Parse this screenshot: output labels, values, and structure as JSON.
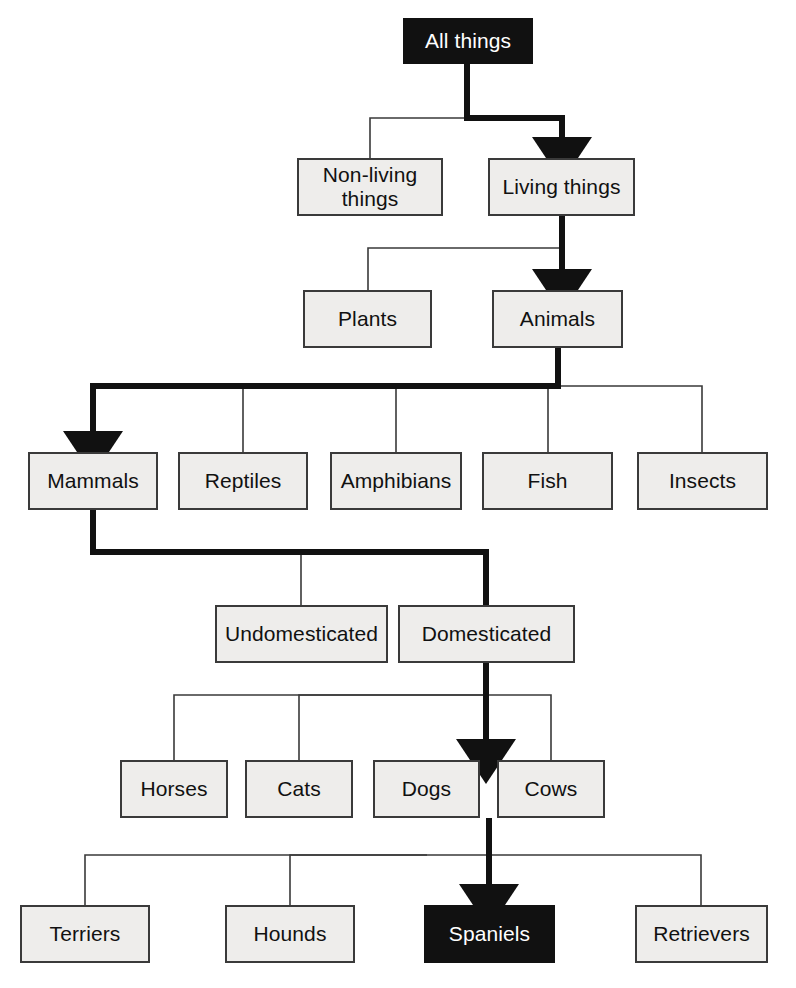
{
  "diagram": {
    "type": "hierarchy-tree",
    "colors": {
      "box_fill": "#eeedeb",
      "box_border": "#3a3a3a",
      "highlight_fill": "#111111",
      "highlight_text": "#ffffff",
      "text": "#111111",
      "edge": "#3a3a3a",
      "emphasis_edge": "#111111",
      "background": "#ffffff"
    },
    "levels": [
      {
        "level": 1,
        "nodes": [
          {
            "id": "all-things",
            "label": "All things",
            "highlight": true,
            "x": 403,
            "y": 18,
            "w": 130,
            "h": 46
          }
        ]
      },
      {
        "level": 2,
        "nodes": [
          {
            "id": "non-living-things",
            "label": "Non-living\nthings",
            "highlight": false,
            "x": 297,
            "y": 158,
            "w": 146,
            "h": 58
          },
          {
            "id": "living-things",
            "label": "Living things",
            "highlight": false,
            "x": 488,
            "y": 158,
            "w": 147,
            "h": 58
          }
        ]
      },
      {
        "level": 3,
        "nodes": [
          {
            "id": "plants",
            "label": "Plants",
            "highlight": false,
            "x": 303,
            "y": 290,
            "w": 129,
            "h": 58
          },
          {
            "id": "animals",
            "label": "Animals",
            "highlight": false,
            "x": 492,
            "y": 290,
            "w": 131,
            "h": 58
          }
        ]
      },
      {
        "level": 4,
        "nodes": [
          {
            "id": "mammals",
            "label": "Mammals",
            "highlight": false,
            "x": 28,
            "y": 452,
            "w": 130,
            "h": 58
          },
          {
            "id": "reptiles",
            "label": "Reptiles",
            "highlight": false,
            "x": 178,
            "y": 452,
            "w": 130,
            "h": 58
          },
          {
            "id": "amphibians",
            "label": "Amphibians",
            "highlight": false,
            "x": 330,
            "y": 452,
            "w": 132,
            "h": 58
          },
          {
            "id": "fish",
            "label": "Fish",
            "highlight": false,
            "x": 482,
            "y": 452,
            "w": 131,
            "h": 58
          },
          {
            "id": "insects",
            "label": "Insects",
            "highlight": false,
            "x": 637,
            "y": 452,
            "w": 131,
            "h": 58
          }
        ]
      },
      {
        "level": 5,
        "nodes": [
          {
            "id": "undomesticated",
            "label": "Undomesticated",
            "highlight": false,
            "x": 215,
            "y": 605,
            "w": 173,
            "h": 58
          },
          {
            "id": "domesticated",
            "label": "Domesticated",
            "highlight": false,
            "x": 398,
            "y": 605,
            "w": 177,
            "h": 58
          }
        ]
      },
      {
        "level": 6,
        "nodes": [
          {
            "id": "horses",
            "label": "Horses",
            "highlight": false,
            "x": 120,
            "y": 760,
            "w": 108,
            "h": 58
          },
          {
            "id": "cats",
            "label": "Cats",
            "highlight": false,
            "x": 245,
            "y": 760,
            "w": 108,
            "h": 58
          },
          {
            "id": "dogs",
            "label": "Dogs",
            "highlight": false,
            "x": 373,
            "y": 760,
            "w": 107,
            "h": 58
          },
          {
            "id": "cows",
            "label": "Cows",
            "highlight": false,
            "x": 497,
            "y": 760,
            "w": 108,
            "h": 58
          }
        ]
      },
      {
        "level": 7,
        "nodes": [
          {
            "id": "terriers",
            "label": "Terriers",
            "highlight": false,
            "x": 20,
            "y": 905,
            "w": 130,
            "h": 58
          },
          {
            "id": "hounds",
            "label": "Hounds",
            "highlight": false,
            "x": 225,
            "y": 905,
            "w": 130,
            "h": 58
          },
          {
            "id": "spaniels",
            "label": "Spaniels",
            "highlight": true,
            "x": 424,
            "y": 905,
            "w": 131,
            "h": 58
          },
          {
            "id": "retrievers",
            "label": "Retrievers",
            "highlight": false,
            "x": 635,
            "y": 905,
            "w": 133,
            "h": 58
          }
        ]
      }
    ],
    "edges": [
      {
        "from": "all-things",
        "to": "non-living-things",
        "emphasis": false
      },
      {
        "from": "all-things",
        "to": "living-things",
        "emphasis": true
      },
      {
        "from": "living-things",
        "to": "plants",
        "emphasis": false
      },
      {
        "from": "living-things",
        "to": "animals",
        "emphasis": true
      },
      {
        "from": "animals",
        "to": "mammals",
        "emphasis": true
      },
      {
        "from": "animals",
        "to": "reptiles",
        "emphasis": false
      },
      {
        "from": "animals",
        "to": "amphibians",
        "emphasis": false
      },
      {
        "from": "animals",
        "to": "fish",
        "emphasis": false
      },
      {
        "from": "animals",
        "to": "insects",
        "emphasis": false
      },
      {
        "from": "mammals",
        "to": "undomesticated",
        "emphasis": false
      },
      {
        "from": "mammals",
        "to": "domesticated",
        "emphasis": true
      },
      {
        "from": "domesticated",
        "to": "horses",
        "emphasis": false
      },
      {
        "from": "domesticated",
        "to": "cats",
        "emphasis": false
      },
      {
        "from": "domesticated",
        "to": "dogs",
        "emphasis": true
      },
      {
        "from": "domesticated",
        "to": "cows",
        "emphasis": false
      },
      {
        "from": "dogs",
        "to": "terriers",
        "emphasis": false
      },
      {
        "from": "dogs",
        "to": "hounds",
        "emphasis": false
      },
      {
        "from": "dogs",
        "to": "spaniels",
        "emphasis": true
      },
      {
        "from": "dogs",
        "to": "retrievers",
        "emphasis": false
      }
    ]
  }
}
